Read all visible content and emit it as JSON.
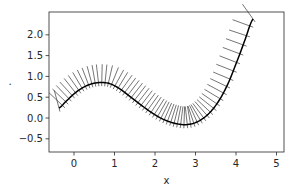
{
  "chart_data": {
    "type": "line",
    "title": "",
    "xlabel": "x",
    "ylabel": ".",
    "xlim": [
      -0.62,
      5.2
    ],
    "ylim": [
      -0.82,
      2.55
    ],
    "grid": false,
    "legend": null,
    "x_ticks": [
      0,
      1,
      2,
      3,
      4,
      5
    ],
    "x_tick_labels": [
      "0",
      "1",
      "2",
      "3",
      "4",
      "5"
    ],
    "y_ticks": [
      -0.5,
      0.0,
      0.5,
      1.0,
      1.5,
      2.0
    ],
    "y_tick_labels": [
      "−0.5",
      "0.0",
      "0.5",
      "1.0",
      "1.5",
      "2.0"
    ],
    "series": [
      {
        "name": "curve",
        "color": "#000000",
        "x": [
          -0.37,
          -0.2,
          0.0,
          0.2,
          0.4,
          0.6,
          0.75,
          0.9,
          1.1,
          1.3,
          1.5,
          1.7,
          1.9,
          2.1,
          2.3,
          2.5,
          2.7,
          2.85,
          3.0,
          3.2,
          3.4,
          3.6,
          3.8,
          4.0,
          4.2,
          4.42
        ],
        "y": [
          0.24,
          0.4,
          0.58,
          0.72,
          0.81,
          0.85,
          0.85,
          0.82,
          0.72,
          0.58,
          0.43,
          0.28,
          0.14,
          0.02,
          -0.07,
          -0.13,
          -0.16,
          -0.15,
          -0.11,
          0.0,
          0.18,
          0.45,
          0.82,
          1.3,
          1.82,
          2.38
        ]
      }
    ],
    "annotations": "normal line segments drawn perpendicular to the curve at each sample point"
  },
  "figure": {
    "width": 298,
    "height": 193,
    "axes_px": {
      "left": 49,
      "top": 12,
      "right": 284,
      "bottom": 152
    },
    "x_px_per_unit": 40.5,
    "x_zero_px": 74,
    "y_px_per_unit": 41.6,
    "y_zero_px": 118,
    "normal_half_length": 0.45,
    "normal_count": 60,
    "line_color": "#3a3a3a",
    "frame_color": "#262626"
  }
}
